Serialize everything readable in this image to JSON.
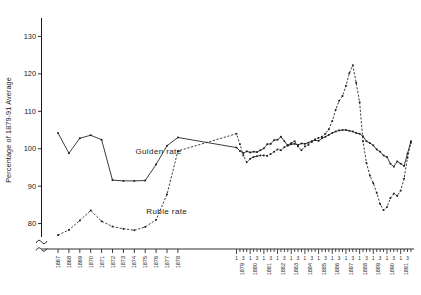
{
  "chart_data": {
    "type": "line",
    "title": "",
    "xlabel": "",
    "ylabel": "Percentage of 1879-91 Average",
    "ylim": [
      74,
      136
    ],
    "yticks": [
      80,
      90,
      100,
      110,
      120,
      130
    ],
    "ytick_labels": [
      "80",
      "90",
      "100",
      "110",
      "120",
      "130"
    ],
    "grid": false,
    "legend_position": "inline-annotation",
    "y_axis_break": true,
    "annual_years": [
      "1867",
      "1868",
      "1869",
      "1870",
      "1871",
      "1872",
      "1873",
      "1874",
      "1875",
      "1876",
      "1877",
      "1878"
    ],
    "quarterly_years": [
      "1879",
      "1880",
      "1881",
      "1882",
      "1883",
      "1884",
      "1885",
      "1886",
      "1887",
      "1888",
      "1889",
      "1890",
      "1891"
    ],
    "quarter_tick_labels": [
      "1",
      "3"
    ],
    "series": [
      {
        "name": "Gulden rate",
        "style": "solid",
        "annual_x": [
          "1867",
          "1868",
          "1869",
          "1870",
          "1871",
          "1872",
          "1873",
          "1874",
          "1875",
          "1876",
          "1877",
          "1878"
        ],
        "annual_values": [
          104.2,
          98.8,
          102.8,
          103.6,
          102.4,
          91.6,
          91.4,
          91.4,
          91.5,
          95.8,
          100.8,
          103.0
        ],
        "quarterly_values": [
          100.3,
          99.4,
          98.8,
          99.3,
          99.0,
          99.2,
          99.1,
          99.6,
          100.1,
          101.2,
          101.3,
          102.3,
          102.4,
          103.2,
          102.0,
          100.8,
          101.2,
          101.3,
          101.0,
          101.4,
          101.3,
          101.6,
          102.0,
          102.3,
          102.1,
          102.8,
          103.2,
          103.7,
          104.2,
          104.6,
          104.9,
          105.0,
          105.0,
          104.8,
          104.6,
          104.2,
          104.0,
          103.3,
          102.0,
          101.5,
          100.9,
          99.8,
          99.2,
          98.2,
          97.8,
          96.0,
          95.2,
          96.6,
          96.0,
          95.4,
          98.7,
          102.0
        ]
      },
      {
        "name": "Ruble rate",
        "style": "dashed",
        "annual_x": [
          "1867",
          "1868",
          "1869",
          "1870",
          "1871",
          "1872",
          "1873",
          "1874",
          "1875",
          "1876",
          "1877",
          "1878"
        ],
        "annual_values": [
          76.9,
          78.3,
          80.8,
          83.5,
          80.6,
          79.2,
          78.6,
          78.2,
          79.1,
          81.0,
          87.8,
          99.4
        ],
        "quarterly_values": [
          104.0,
          101.2,
          98.2,
          96.4,
          97.3,
          97.8,
          98.0,
          98.2,
          98.2,
          98.1,
          98.6,
          99.2,
          99.8,
          99.6,
          100.4,
          101.0,
          101.5,
          102.0,
          100.6,
          99.6,
          100.6,
          101.0,
          101.8,
          102.5,
          102.9,
          103.2,
          104.0,
          105.2,
          107.4,
          110.4,
          112.8,
          114.1,
          116.8,
          120.2,
          122.3,
          117.6,
          112.4,
          102.0,
          96.2,
          92.8,
          90.8,
          88.2,
          85.2,
          83.6,
          84.4,
          86.8,
          88.0,
          87.4,
          88.8,
          92.0,
          97.6,
          101.6
        ]
      }
    ],
    "annotations": [
      {
        "text": "Gulden rate",
        "x_year": "1873",
        "y_value": 98.5
      },
      {
        "text": "Ruble rate",
        "x_year": "1874",
        "y_value": 82.5
      }
    ]
  }
}
